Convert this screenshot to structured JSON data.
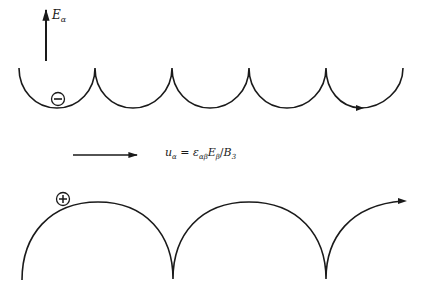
{
  "figure": {
    "field_label": {
      "symbol": "E",
      "subscript": "α"
    },
    "drift_formula": {
      "lhs": "u",
      "lhs_sub": "α",
      "eq": " = ",
      "eps": "ε",
      "eps_sub": "αβ",
      "e": "E",
      "e_sub": "β",
      "div": "/",
      "b": "B",
      "b_sub": "3"
    },
    "negative_charge_symbol": "−",
    "positive_charge_symbol": "+",
    "stroke_color": "#1a1a1a",
    "top_trajectory": {
      "particle": "negative",
      "cusps_x": [
        95,
        172,
        249,
        326
      ],
      "cusp_y": 68,
      "trough_y": 108
    },
    "bottom_trajectory": {
      "particle": "positive",
      "cusps_x": [
        173,
        326
      ],
      "cusp_y": 279,
      "crest_y": 202
    }
  }
}
